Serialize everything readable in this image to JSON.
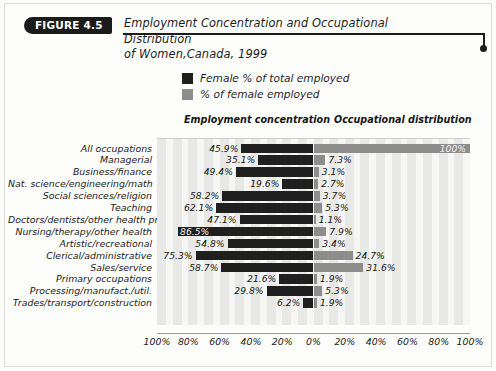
{
  "figure": {
    "badge": "FIGURE 4.5",
    "title_line1": "Employment Concentration and Occupational Distribution",
    "title_line2": "of Women,Canada, 1999"
  },
  "legend": [
    {
      "label": "Female % of total employed",
      "color": "#1f1f1f",
      "key": "concentration"
    },
    {
      "label": "% of female employed",
      "color": "#8d8d8d",
      "key": "distribution"
    }
  ],
  "columns": {
    "left": "Employment concentration",
    "right": "Occupational distribution"
  },
  "axis": {
    "ticks": [
      "100%",
      "80%",
      "60%",
      "40%",
      "20%",
      "0%",
      "20%",
      "40%",
      "60%",
      "80%",
      "100%"
    ],
    "left_max": 100,
    "right_max": 100
  },
  "chart_data": {
    "type": "bar",
    "orientation": "horizontal-diverging",
    "title": "Employment Concentration and Occupational Distribution of Women,Canada, 1999",
    "xlabel": "",
    "ylabel": "",
    "xlim": [
      -100,
      100
    ],
    "grid": false,
    "legend_position": "top-center",
    "categories": [
      "All occupations",
      "Managerial",
      "Business/finance",
      "Nat. science/engineering/math",
      "Social sciences/religion",
      "Teaching",
      "Doctors/dentists/other health prof.",
      "Nursing/therapy/other health",
      "Artistic/recreational",
      "Clerical/administrative",
      "Sales/service",
      "Primary occupations",
      "Processing/manufact./util.",
      "Trades/transport/construction"
    ],
    "series": [
      {
        "name": "Female % of total employed",
        "color": "#1f1f1f",
        "side": "left",
        "values": [
          45.9,
          35.1,
          49.4,
          19.6,
          58.2,
          62.1,
          47.1,
          86.5,
          54.8,
          75.3,
          58.7,
          21.6,
          29.8,
          6.2
        ],
        "labels": [
          "45.9%",
          "35.1%",
          "49.4%",
          "19.6%",
          "58.2%",
          "62.1%",
          "47.1%",
          "86.5%",
          "54.8%",
          "75.3%",
          "58.7%",
          "21.6%",
          "29.8%",
          "6.2%"
        ],
        "label_inside": [
          false,
          false,
          false,
          false,
          false,
          false,
          false,
          true,
          false,
          false,
          false,
          false,
          false,
          false
        ]
      },
      {
        "name": "% of female employed",
        "color": "#8d8d8d",
        "side": "right",
        "values": [
          100,
          7.3,
          3.1,
          2.7,
          3.7,
          5.3,
          1.1,
          7.9,
          3.4,
          24.7,
          31.6,
          1.9,
          5.3,
          1.9
        ],
        "labels": [
          "100%",
          "7.3%",
          "3.1%",
          "2.7%",
          "3.7%",
          "5.3%",
          "1.1%",
          "7.9%",
          "3.4%",
          "24.7%",
          "31.6%",
          "1.9%",
          "5.3%",
          "1.9%"
        ],
        "label_inside": [
          true,
          false,
          false,
          false,
          false,
          false,
          false,
          false,
          false,
          false,
          false,
          false,
          false,
          false
        ]
      }
    ]
  }
}
